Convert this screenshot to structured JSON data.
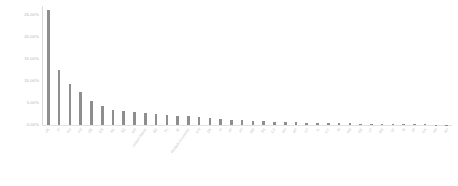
{
  "chart_data": {
    "type": "bar",
    "title": "",
    "subtitle": "",
    "xlabel": "",
    "ylabel": "",
    "ylim": [
      0,
      27
    ],
    "grid": false,
    "legend": null,
    "y_ticks": [
      "0.00%",
      "5.00%",
      "10.00%",
      "15.00%",
      "20.00%",
      "25.00%"
    ],
    "y_tick_values": [
      0,
      5,
      10,
      15,
      20,
      25
    ],
    "value_format": "percent",
    "bar_color": "#8e8e8e",
    "axis_color": "#d9d9d9",
    "label_color": "#c2c2c2",
    "categories": [
      "UK",
      "IT",
      "RU",
      "FR",
      "DE",
      "ES",
      "NL",
      "SE",
      "GR",
      "United States",
      "BE",
      "PL",
      "IE",
      "Multiple Countries",
      "CH",
      "DK",
      "FI",
      "AT",
      "PT",
      "NO",
      "SK",
      "CZ",
      "HU",
      "MT",
      "LU",
      "IL",
      "CY",
      "SI",
      "RO",
      "EE",
      "LT",
      "BG",
      "LV",
      "IS",
      "JP",
      "CA",
      "HR",
      "AU"
    ],
    "values": [
      26.0,
      12.4,
      9.2,
      7.4,
      5.5,
      4.3,
      3.4,
      3.1,
      2.9,
      2.7,
      2.4,
      2.2,
      2.1,
      1.95,
      1.8,
      1.55,
      1.35,
      1.2,
      1.05,
      0.95,
      0.85,
      0.78,
      0.7,
      0.62,
      0.55,
      0.5,
      0.45,
      0.4,
      0.36,
      0.32,
      0.28,
      0.25,
      0.22,
      0.19,
      0.16,
      0.13,
      0.1,
      0.08
    ]
  }
}
